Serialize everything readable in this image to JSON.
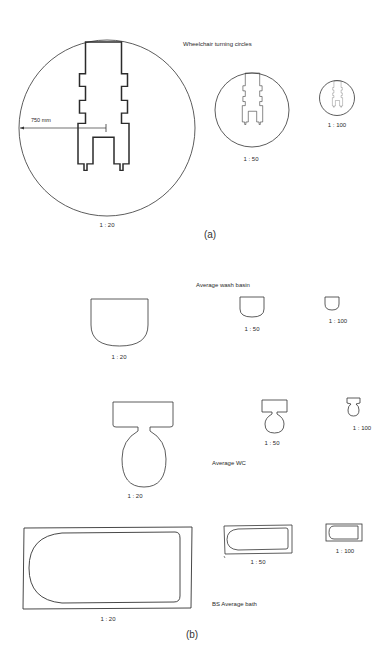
{
  "figure_a": {
    "title": "Wheelchair turning circles",
    "dimension_label": "750 mm",
    "part_label": "(a)",
    "scales": [
      {
        "label": "1 : 20"
      },
      {
        "label": "1 : 50"
      },
      {
        "label": "1 : 100"
      }
    ]
  },
  "figure_b": {
    "part_label": "(b)",
    "wash_basin": {
      "title": "Average wash basin",
      "scales": [
        {
          "label": "1 : 20"
        },
        {
          "label": "1 : 50"
        },
        {
          "label": "1 : 100"
        }
      ]
    },
    "wc": {
      "title": "Average WC",
      "scales": [
        {
          "label": "1 : 20"
        },
        {
          "label": "1 : 50"
        },
        {
          "label": "1 : 100"
        }
      ]
    },
    "bath": {
      "title": "BS Average bath",
      "scales": [
        {
          "label": "1 : 20"
        },
        {
          "label": "1 : 50"
        },
        {
          "label": "1 : 100"
        }
      ]
    }
  },
  "colors": {
    "line": "#2b2b2b",
    "background": "#ffffff"
  }
}
